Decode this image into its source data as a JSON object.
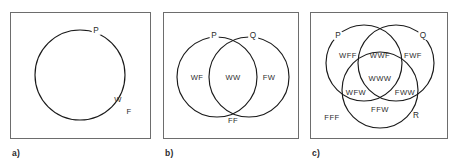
{
  "figure": {
    "background_color": "#ffffff",
    "stroke_color": "#1a1a1a",
    "box_border_color": "#6d6d6d",
    "text_color": "#2b2b2b"
  },
  "panels": [
    {
      "caption": "a)",
      "set_labels": [
        {
          "name": "P",
          "text": "P"
        }
      ],
      "region_labels": [
        {
          "name": "W",
          "text": "W"
        },
        {
          "name": "F",
          "text": "F"
        }
      ]
    },
    {
      "caption": "b)",
      "set_labels": [
        {
          "name": "P",
          "text": "P"
        },
        {
          "name": "Q",
          "text": "Q"
        }
      ],
      "region_labels": [
        {
          "name": "WF",
          "text": "WF"
        },
        {
          "name": "WW",
          "text": "WW"
        },
        {
          "name": "FW",
          "text": "FW"
        },
        {
          "name": "FF",
          "text": "FF"
        }
      ]
    },
    {
      "caption": "c)",
      "set_labels": [
        {
          "name": "P",
          "text": "P"
        },
        {
          "name": "Q",
          "text": "Q"
        },
        {
          "name": "R",
          "text": "R"
        }
      ],
      "region_labels": [
        {
          "name": "WFF",
          "text": "WFF"
        },
        {
          "name": "WWF",
          "text": "WWF"
        },
        {
          "name": "FWF",
          "text": "FWF"
        },
        {
          "name": "WWW",
          "text": "WWW"
        },
        {
          "name": "WFW",
          "text": "WFW"
        },
        {
          "name": "FWW",
          "text": "FWW"
        },
        {
          "name": "FFW",
          "text": "FFW"
        },
        {
          "name": "FFF",
          "text": "FFF"
        }
      ]
    }
  ]
}
